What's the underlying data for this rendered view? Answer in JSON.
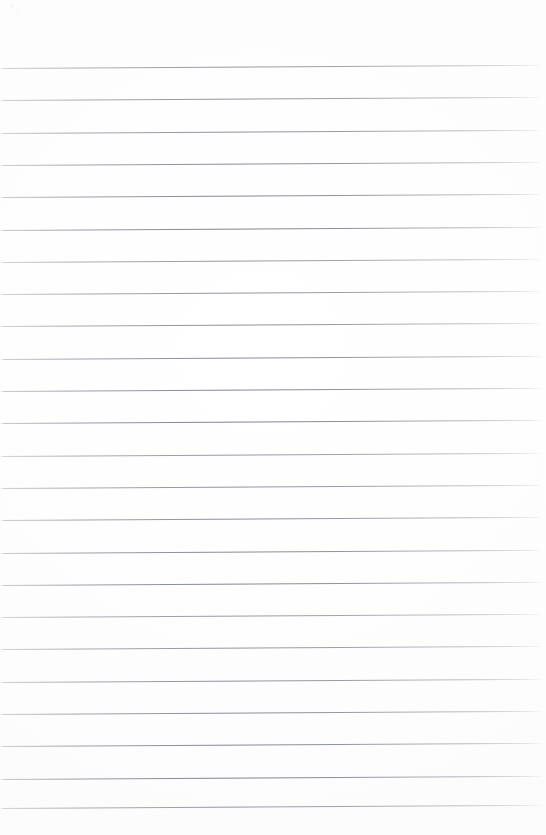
{
  "document": {
    "kind": "scanned-page",
    "title": "Blank Ruled Notebook Page",
    "content_text": "",
    "page_width": 546,
    "page_height": 835,
    "background_color": "#fefefe",
    "has_text": false,
    "has_margin_rule": false,
    "has_header": false,
    "has_page_number": false
  },
  "ruling": {
    "line_color": "#7d838c",
    "line_color_light": "#9aa0a8",
    "line_count": 23,
    "line_thickness_px": 1,
    "first_line_y": 68,
    "line_spacing_px": 32.3,
    "line_start_x": 0,
    "line_end_x": 541,
    "tilt_degrees": -0.33,
    "line_y_positions": [
      68,
      100.3,
      132.6,
      164.9,
      197.2,
      229.5,
      261.8,
      294.1,
      326.4,
      358.7,
      391.0,
      423.3,
      455.6,
      487.9,
      520.2,
      552.5,
      584.8,
      617.1,
      649.4,
      681.7,
      714.0,
      746.3,
      778.6
    ],
    "final_line_y": 808
  },
  "artifacts": {
    "speckles": [
      {
        "x": 12,
        "y": 6,
        "size": 3,
        "opacity": 0.2
      },
      {
        "x": 18,
        "y": 10,
        "size": 2,
        "opacity": 0.14
      },
      {
        "x": 247,
        "y": 163,
        "size": 2,
        "opacity": 0.1
      },
      {
        "x": 151,
        "y": 352,
        "size": 2,
        "opacity": 0.09
      },
      {
        "x": 418,
        "y": 487,
        "size": 2,
        "opacity": 0.08
      },
      {
        "x": 93,
        "y": 622,
        "size": 2,
        "opacity": 0.08
      },
      {
        "x": 500,
        "y": 231,
        "size": 2,
        "opacity": 0.07
      },
      {
        "x": 330,
        "y": 712,
        "size": 2,
        "opacity": 0.07
      }
    ]
  }
}
